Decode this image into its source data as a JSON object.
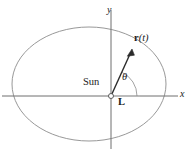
{
  "figure": {
    "colors": {
      "ellipse_stroke": "#8c8c8c",
      "axis_stroke": "#6e6e6e",
      "vector_stroke": "#2b2b2b",
      "angmom_ray_stroke": "#bfbfbf",
      "arc_stroke": "#8c8c8c",
      "focus_marker": "#4d4d4d",
      "background": "#ffffff",
      "text": "#1a1a1a"
    },
    "axes": {
      "x_label": "x",
      "y_label": "y",
      "origin": {
        "x": 111,
        "y": 96
      }
    },
    "orbit": {
      "shape": "ellipse",
      "center": {
        "x": 89,
        "y": 84
      },
      "rx": 77,
      "ry": 57
    },
    "labels": {
      "sun": "Sun",
      "theta": "θ",
      "angular_momentum": "L",
      "position_vector_bold": "r",
      "position_vector_arg": "(t)"
    },
    "vector": {
      "from": {
        "x": 111,
        "y": 96
      },
      "to": {
        "x": 132,
        "y": 51
      },
      "angle_degrees": 65
    },
    "angle_arc": {
      "radius": 26,
      "start_degrees": 0,
      "end_degrees": 65
    }
  }
}
